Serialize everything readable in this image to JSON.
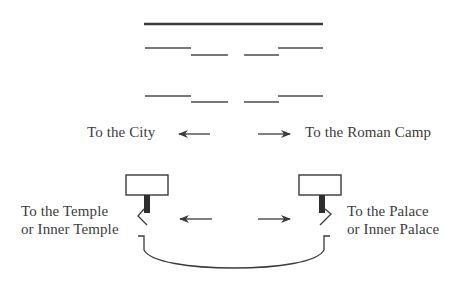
{
  "diagram": {
    "labels": {
      "city": "To the City",
      "roman_camp": "To the Roman Camp",
      "temple": {
        "line1": "To the Temple",
        "line2": "or Inner Temple"
      },
      "palace": {
        "line1": "To the Palace",
        "line2": "or Inner Palace"
      }
    },
    "colors": {
      "ink": "#3a3a3a",
      "background": "#ffffff"
    },
    "arrows": [
      {
        "name": "arrow-to-city",
        "direction": "left"
      },
      {
        "name": "arrow-to-roman-camp",
        "direction": "right"
      },
      {
        "name": "arrow-to-temple",
        "direction": "left"
      },
      {
        "name": "arrow-to-palace",
        "direction": "right"
      }
    ]
  }
}
